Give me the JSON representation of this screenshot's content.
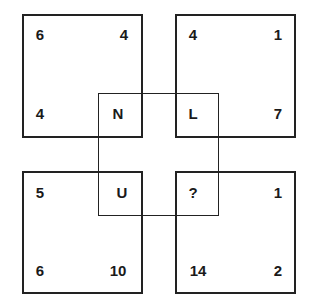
{
  "puzzle": {
    "boxes": {
      "top_left": {
        "tl": "6",
        "tr": "4",
        "bl": "4",
        "br": "N"
      },
      "top_right": {
        "tl": "4",
        "tr": "1",
        "bl": "L",
        "br": "7"
      },
      "bottom_left": {
        "tl": "5",
        "tr": "U",
        "bl": "6",
        "br": "10"
      },
      "bottom_right": {
        "tl": "?",
        "tr": "1",
        "bl": "14",
        "br": "2"
      }
    },
    "line_color": "#222222",
    "text_color": "#1a1a1a"
  }
}
